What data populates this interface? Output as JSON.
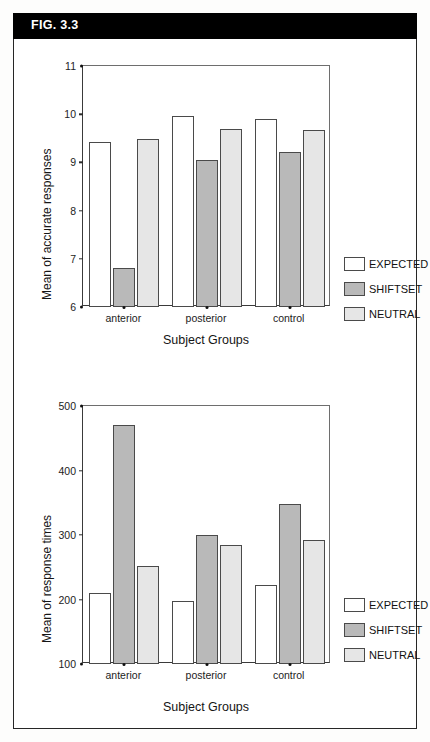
{
  "figure": {
    "label": "FIG. 3.3"
  },
  "legend_labels": {
    "expected": "EXPECTED",
    "shiftset": "SHIFTSET",
    "neutral": "NEUTRAL"
  },
  "colors": {
    "expected": "#ffffff",
    "shiftset": "#b9b9b9",
    "neutral": "#e6e6e6",
    "outline": "#4a4a4a",
    "banner": "#000000",
    "banner_text": "#ffffff"
  },
  "chart_data": [
    {
      "id": "accuracy",
      "type": "bar",
      "title": "",
      "xlabel": "Subject Groups",
      "ylabel": "Mean of accurate responses",
      "categories": [
        "anterior",
        "posterior",
        "control"
      ],
      "ylim": [
        6,
        11
      ],
      "yticks": [
        6,
        7,
        8,
        9,
        10,
        11
      ],
      "grid": false,
      "legend_position": "right",
      "series": [
        {
          "name": "EXPECTED",
          "values": [
            9.42,
            9.97,
            9.9
          ]
        },
        {
          "name": "SHIFTSET",
          "values": [
            6.8,
            9.05,
            9.22
          ]
        },
        {
          "name": "NEUTRAL",
          "values": [
            9.48,
            9.7,
            9.68
          ]
        }
      ]
    },
    {
      "id": "response-times",
      "type": "bar",
      "title": "",
      "xlabel": "Subject Groups",
      "ylabel": "Mean of response times",
      "categories": [
        "anterior",
        "posterior",
        "control"
      ],
      "ylim": [
        100,
        500
      ],
      "yticks": [
        100,
        200,
        300,
        400,
        500
      ],
      "grid": false,
      "legend_position": "right",
      "series": [
        {
          "name": "EXPECTED",
          "values": [
            210,
            197,
            222
          ]
        },
        {
          "name": "SHIFTSET",
          "values": [
            470,
            300,
            348
          ]
        },
        {
          "name": "NEUTRAL",
          "values": [
            252,
            285,
            293
          ]
        }
      ]
    }
  ]
}
